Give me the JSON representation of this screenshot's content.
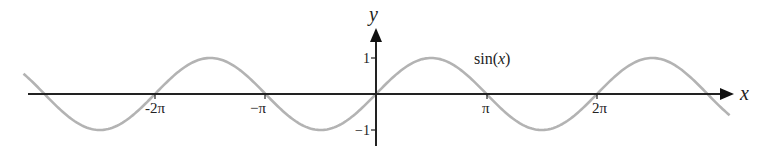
{
  "chart_data": {
    "type": "line",
    "title": "",
    "xlabel": "x",
    "ylabel": "y",
    "series": [
      {
        "name": "sin(x)",
        "function": "sin(x)",
        "x_range": [
          -3.19,
          3.2
        ],
        "x_unit": "pi"
      }
    ],
    "x_ticks": [
      "-2π",
      "-π",
      "π",
      "2π"
    ],
    "x_tick_values_in_pi": [
      -2,
      -1,
      1,
      2
    ],
    "y_ticks": [
      "1",
      "-1"
    ],
    "y_tick_values": [
      1,
      -1
    ],
    "annotation": "sin(x)",
    "grid": false,
    "legend": "none",
    "colors": {
      "axes": "#222222",
      "curve": "#b3b3b3"
    }
  },
  "labels": {
    "x_axis": "x",
    "y_axis": "y",
    "curve": "sin(x)",
    "curve_fn": "sin(",
    "curve_var": "x",
    "curve_close": ")",
    "tick_neg2pi": "-2π",
    "tick_negpi": "−π",
    "tick_pi": "π",
    "tick_2pi": "2π",
    "tick_y1": "1",
    "tick_yneg1": "−1"
  }
}
